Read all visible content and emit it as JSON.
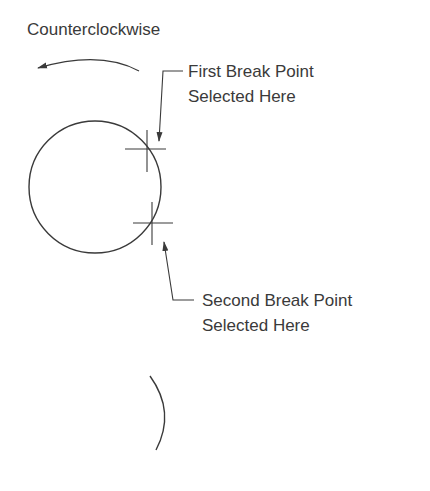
{
  "labels": {
    "direction": "Counterclockwise",
    "first_line1": "First Break Point",
    "first_line2": "Selected Here",
    "second_line1": "Second Break Point",
    "second_line2": "Selected Here"
  },
  "colors": {
    "stroke": "#3a3a3a",
    "background": "#ffffff"
  }
}
